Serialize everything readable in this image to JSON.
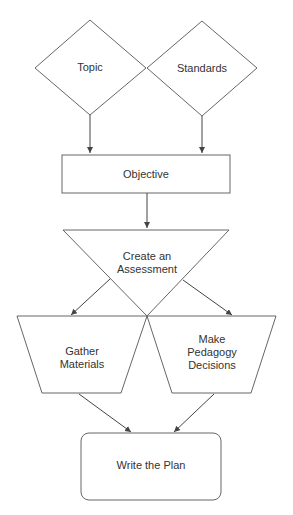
{
  "diagram": {
    "type": "flowchart",
    "nodes": [
      {
        "id": "topic",
        "shape": "diamond",
        "label": "Topic"
      },
      {
        "id": "standards",
        "shape": "diamond",
        "label": "Standards"
      },
      {
        "id": "objective",
        "shape": "rectangle",
        "label": "Objective"
      },
      {
        "id": "assessment",
        "shape": "inverted-triangle",
        "label_line1": "Create an",
        "label_line2": "Assessment"
      },
      {
        "id": "gather",
        "shape": "trapezoid",
        "label_line1": "Gather",
        "label_line2": "Materials"
      },
      {
        "id": "pedagogy",
        "shape": "trapezoid",
        "label_line1": "Make",
        "label_line2": "Pedagogy",
        "label_line3": "Decisions"
      },
      {
        "id": "plan",
        "shape": "rounded-rectangle",
        "label": "Write the Plan"
      }
    ],
    "edges": [
      {
        "from": "topic",
        "to": "objective"
      },
      {
        "from": "standards",
        "to": "objective"
      },
      {
        "from": "objective",
        "to": "assessment"
      },
      {
        "from": "assessment",
        "to": "gather"
      },
      {
        "from": "assessment",
        "to": "pedagogy"
      },
      {
        "from": "gather",
        "to": "plan"
      },
      {
        "from": "pedagogy",
        "to": "plan"
      }
    ],
    "colors": {
      "stroke": "#555555",
      "text": "#333333",
      "background": "#ffffff"
    }
  }
}
